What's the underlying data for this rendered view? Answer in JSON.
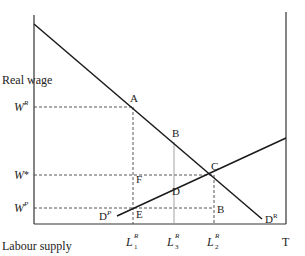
{
  "diagram": {
    "y_axis_label": "Real wage",
    "x_axis_label": "Labour supply",
    "right_end_label": "T",
    "wages": [
      {
        "id": "WR",
        "base": "W",
        "sup": "R",
        "y": 107
      },
      {
        "id": "Wstar",
        "base": "W",
        "sup": "*",
        "y": 175
      },
      {
        "id": "WP",
        "base": "W",
        "sup": "P",
        "y": 208
      }
    ],
    "labour": [
      {
        "id": "L1R",
        "base": "L",
        "sup": "R",
        "sub": "1",
        "x": 133
      },
      {
        "id": "L3R",
        "base": "L",
        "sup": "R",
        "sub": "3",
        "x": 174
      },
      {
        "id": "L2R",
        "base": "L",
        "sup": "R",
        "sub": "2",
        "x": 214
      }
    ],
    "points": [
      {
        "label": "A",
        "x": 133,
        "y": 107
      },
      {
        "label": "B",
        "x": 174,
        "y": 142
      },
      {
        "label": "C",
        "x": 214,
        "y": 175
      },
      {
        "label": "F",
        "x": 133,
        "y": 175
      },
      {
        "label": "D",
        "x": 174,
        "y": 190
      },
      {
        "label": "E",
        "x": 133,
        "y": 208
      },
      {
        "label": "B",
        "x": 214,
        "y": 208
      }
    ],
    "curves": [
      {
        "name": "demand-rich",
        "base": "D",
        "sup": "R",
        "x1": 34,
        "y1": 24,
        "x2": 262,
        "y2": 219
      },
      {
        "name": "demand-poor",
        "base": "D",
        "sup": "P",
        "x1": 117,
        "y1": 216,
        "x2": 286,
        "y2": 138
      }
    ]
  }
}
